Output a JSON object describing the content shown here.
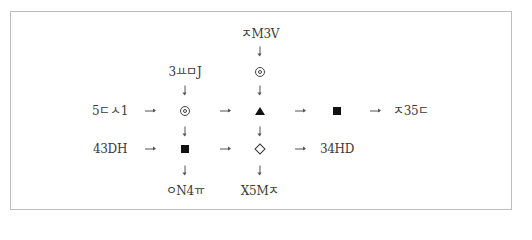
{
  "diagram": {
    "inputs": {
      "top": "ㅈM3V",
      "col1_top": "3ㅛㅁJ",
      "row1_left": "5ㄷㅅ1",
      "row2_left": "43DH"
    },
    "outputs": {
      "row1_right": "ㅈ35ㄷ",
      "row2_right": "34HD",
      "col1_bottom": "ㅇN4ㅠ",
      "col2_bottom": "X5Mㅈ"
    },
    "symbols": {
      "top_col2": "double-circle",
      "row1_col1": "double-circle",
      "row1_col2": "black-triangle",
      "row1_col3": "black-square",
      "row2_col1": "black-square",
      "row2_col2": "white-diamond"
    },
    "colors": {
      "border": "#bdbdbd",
      "text": "#3a3a3a",
      "symbol": "#111111"
    }
  }
}
